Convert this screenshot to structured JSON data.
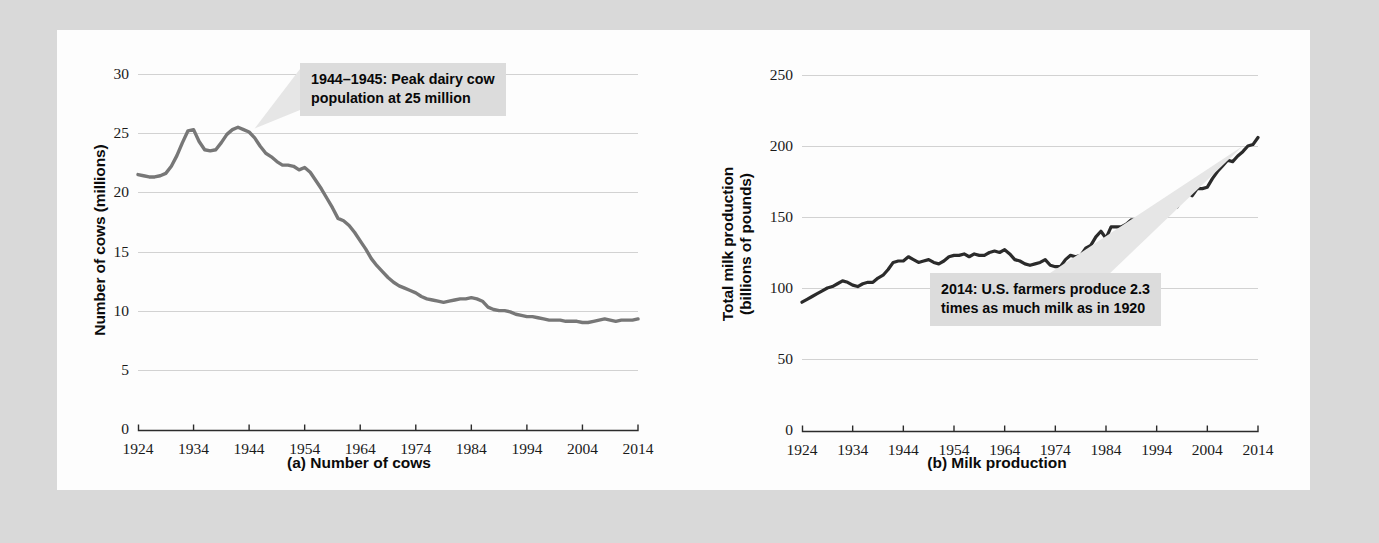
{
  "figure": {
    "background_color": "#d9d9d9",
    "panel_color": "#fdfdfd",
    "line_color_a": "#777777",
    "line_color_b": "#2b2b2b",
    "grid_color": "#d2d2d2",
    "callout_bg": "#dcdcdc"
  },
  "chart_data": [
    {
      "type": "line",
      "id": "chart-a",
      "title": "(a) Number of cows",
      "caption": "(a) Number of cows",
      "xlabel": "",
      "ylabel": "Number of cows (millions)",
      "xlim": [
        1924,
        2014
      ],
      "ylim": [
        0,
        30
      ],
      "grid": true,
      "legend": "none",
      "xticks": [
        1924,
        1934,
        1944,
        1954,
        1964,
        1974,
        1984,
        1994,
        2004,
        2014
      ],
      "yticks": [
        0,
        5,
        10,
        15,
        20,
        25,
        30
      ],
      "annotations": [
        {
          "id": "peak-cows",
          "text": "1944–1945: Peak dairy cow\npopulation at 25 million",
          "points_to_x": 1945,
          "points_to_y": 25.4
        }
      ],
      "series": [
        {
          "name": "Number of dairy cows (millions)",
          "x": [
            1924,
            1925,
            1926,
            1927,
            1928,
            1929,
            1930,
            1931,
            1932,
            1933,
            1934,
            1935,
            1936,
            1937,
            1938,
            1939,
            1940,
            1941,
            1942,
            1943,
            1944,
            1945,
            1946,
            1947,
            1948,
            1949,
            1950,
            1951,
            1952,
            1953,
            1954,
            1955,
            1956,
            1957,
            1958,
            1959,
            1960,
            1961,
            1962,
            1963,
            1964,
            1965,
            1966,
            1967,
            1968,
            1969,
            1970,
            1971,
            1972,
            1973,
            1974,
            1975,
            1976,
            1977,
            1978,
            1979,
            1980,
            1981,
            1982,
            1983,
            1984,
            1985,
            1986,
            1987,
            1988,
            1989,
            1990,
            1991,
            1992,
            1993,
            1994,
            1995,
            1996,
            1997,
            1998,
            1999,
            2000,
            2001,
            2002,
            2003,
            2004,
            2005,
            2006,
            2007,
            2008,
            2009,
            2010,
            2011,
            2012,
            2013,
            2014
          ],
          "values": [
            21.5,
            21.4,
            21.3,
            21.3,
            21.4,
            21.6,
            22.2,
            23.1,
            24.2,
            25.2,
            25.3,
            24.3,
            23.6,
            23.5,
            23.6,
            24.2,
            24.9,
            25.3,
            25.5,
            25.3,
            25.1,
            24.6,
            23.9,
            23.3,
            23.0,
            22.6,
            22.3,
            22.3,
            22.2,
            21.9,
            22.1,
            21.7,
            21.0,
            20.3,
            19.5,
            18.7,
            17.8,
            17.6,
            17.2,
            16.6,
            15.9,
            15.2,
            14.4,
            13.8,
            13.3,
            12.8,
            12.4,
            12.1,
            11.9,
            11.7,
            11.5,
            11.2,
            11.0,
            10.9,
            10.8,
            10.7,
            10.8,
            10.9,
            11.0,
            11.0,
            11.1,
            11.0,
            10.8,
            10.3,
            10.1,
            10.0,
            10.0,
            9.9,
            9.7,
            9.6,
            9.5,
            9.5,
            9.4,
            9.3,
            9.2,
            9.2,
            9.2,
            9.1,
            9.1,
            9.1,
            9.0,
            9.0,
            9.1,
            9.2,
            9.3,
            9.2,
            9.1,
            9.2,
            9.2,
            9.2,
            9.3
          ]
        }
      ]
    },
    {
      "type": "line",
      "id": "chart-b",
      "title": "(b) Milk production",
      "caption": "(b) Milk production",
      "xlabel": "",
      "ylabel": "Total milk production\n(billions of pounds)",
      "xlim": [
        1924,
        2014
      ],
      "ylim": [
        0,
        250
      ],
      "grid": true,
      "legend": "none",
      "xticks": [
        1924,
        1934,
        1944,
        1954,
        1964,
        1974,
        1984,
        1994,
        2004,
        2014
      ],
      "yticks": [
        0,
        50,
        100,
        150,
        200,
        250
      ],
      "annotations": [
        {
          "id": "production-2014",
          "text": "2014: U.S. farmers produce 2.3\ntimes as much milk as in 1920",
          "points_to_x": 2011,
          "points_to_y": 200
        }
      ],
      "series": [
        {
          "name": "Total milk production (billions of pounds)",
          "x": [
            1924,
            1925,
            1926,
            1927,
            1928,
            1929,
            1930,
            1931,
            1932,
            1933,
            1934,
            1935,
            1936,
            1937,
            1938,
            1939,
            1940,
            1941,
            1942,
            1943,
            1944,
            1945,
            1946,
            1947,
            1948,
            1949,
            1950,
            1951,
            1952,
            1953,
            1954,
            1955,
            1956,
            1957,
            1958,
            1959,
            1960,
            1961,
            1962,
            1963,
            1964,
            1965,
            1966,
            1967,
            1968,
            1969,
            1970,
            1971,
            1972,
            1973,
            1974,
            1975,
            1976,
            1977,
            1978,
            1979,
            1980,
            1981,
            1982,
            1983,
            1984,
            1985,
            1986,
            1987,
            1988,
            1989,
            1990,
            1991,
            1992,
            1993,
            1994,
            1995,
            1996,
            1997,
            1998,
            1999,
            2000,
            2001,
            2002,
            2003,
            2004,
            2005,
            2006,
            2007,
            2008,
            2009,
            2010,
            2011,
            2012,
            2013,
            2014
          ],
          "values": [
            90,
            92,
            94,
            96,
            98,
            100,
            101,
            103,
            105,
            104,
            102,
            101,
            103,
            104,
            104,
            107,
            109,
            113,
            118,
            119,
            119,
            122,
            120,
            118,
            119,
            120,
            118,
            117,
            119,
            122,
            123,
            123,
            124,
            122,
            124,
            123,
            123,
            125,
            126,
            125,
            127,
            124,
            120,
            119,
            117,
            116,
            117,
            118,
            120,
            116,
            115,
            115,
            120,
            123,
            122,
            123,
            128,
            130,
            136,
            140,
            135,
            143,
            143,
            143,
            145,
            148,
            148,
            148,
            151,
            151,
            154,
            155,
            154,
            157,
            157,
            163,
            168,
            165,
            170,
            170,
            171,
            177,
            182,
            186,
            190,
            189,
            193,
            196,
            200,
            201,
            206
          ]
        }
      ]
    }
  ]
}
